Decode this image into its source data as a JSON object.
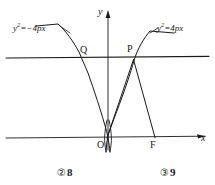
{
  "figure": {
    "axes": {
      "y_axis_label": "y",
      "x_axis_label": "x",
      "origin_label": "O"
    },
    "curve_labels": {
      "left": {
        "base": "y",
        "exponent": "2",
        "rest": "=−4px"
      },
      "right": {
        "base": "y",
        "exponent": "2",
        "rest": "=4px"
      }
    },
    "points": [
      {
        "name": "Q",
        "label": "Q"
      },
      {
        "name": "P",
        "label": "P"
      },
      {
        "name": "O",
        "label": "O"
      },
      {
        "name": "F",
        "label": "F"
      }
    ],
    "point_labels": {
      "q": "Q",
      "p": "P",
      "o": "O",
      "f": "F"
    },
    "colors": {
      "stroke": "#1a1a1a",
      "background": "#ffffff"
    }
  },
  "options": [
    {
      "marker": "②",
      "value": "8"
    },
    {
      "marker": "③",
      "value": "9"
    }
  ],
  "option_items": {
    "two": {
      "marker": "②",
      "value": "8"
    },
    "three": {
      "marker": "③",
      "value": "9"
    }
  }
}
